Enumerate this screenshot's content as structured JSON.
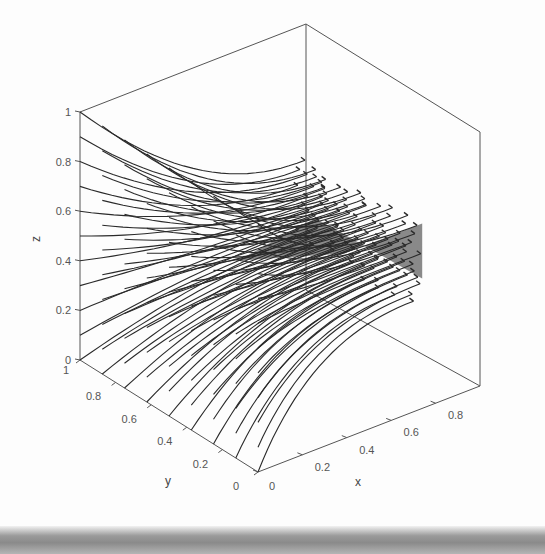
{
  "chart_data": {
    "type": "streamline-3d",
    "title": "",
    "xlabel": "x",
    "ylabel": "y",
    "zlabel": "z",
    "xlim": [
      0,
      1
    ],
    "ylim": [
      0,
      1
    ],
    "zlim": [
      0,
      1
    ],
    "x_ticks": [
      "0",
      "0.2",
      "0.4",
      "0.6",
      "0.8"
    ],
    "y_ticks": [
      "0",
      "0.2",
      "0.4",
      "0.6",
      "0.8",
      "1"
    ],
    "z_ticks": [
      "0",
      "0.2",
      "0.4",
      "0.6",
      "0.8",
      "1"
    ],
    "grid": false,
    "legend": null,
    "streamline_seed_face": "x=0",
    "streamline_end_region": {
      "x": [
        0.5,
        0.9
      ],
      "y": [
        0.2,
        0.8
      ],
      "z": [
        0.3,
        0.6
      ]
    },
    "line_color": "#2a2a2a",
    "box_color": "#555555"
  }
}
